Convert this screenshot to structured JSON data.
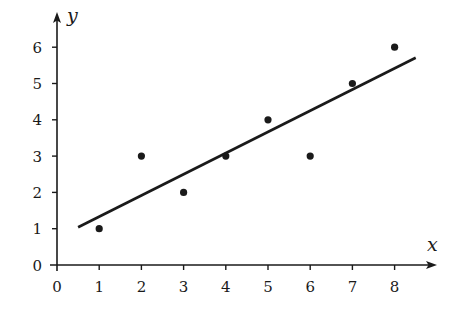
{
  "chart_data": {
    "type": "scatter",
    "title": "",
    "xlabel": "x",
    "ylabel": "y",
    "xlim": [
      0,
      8.9
    ],
    "ylim": [
      0,
      6.9
    ],
    "grid": false,
    "legend": null,
    "x_ticks": [
      0,
      1,
      2,
      3,
      4,
      5,
      6,
      7,
      8
    ],
    "y_ticks": [
      0,
      1,
      2,
      3,
      4,
      5,
      6
    ],
    "series": [
      {
        "name": "data points",
        "type": "scatter",
        "x": [
          1,
          2,
          3,
          4,
          5,
          6,
          7,
          8
        ],
        "y": [
          1,
          3,
          2,
          3,
          4,
          3,
          5,
          6
        ]
      },
      {
        "name": "best-fit line",
        "type": "line",
        "slope": 0.5833,
        "intercept": 0.75,
        "x": [
          0.5,
          8.5
        ],
        "y": [
          1.04,
          5.71
        ]
      }
    ]
  },
  "colors": {
    "ink": "#1a1a1a",
    "background": "#ffffff"
  }
}
